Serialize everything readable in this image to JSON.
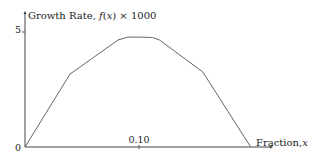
{
  "chart_data": {
    "type": "line",
    "title": "",
    "xlabel": "Fraction, x",
    "ylabel": "Growth Rate, f(x) × 1000",
    "ylabel_parts": {
      "prefix": "Growth Rate, ",
      "func": "f",
      "paren_open": "(",
      "var": "x",
      "paren_close": ")",
      "suffix": " × 1000"
    },
    "xlabel_parts": {
      "prefix": "Fraction,",
      "var": "x"
    },
    "x_ticks": [
      {
        "value": 0.1,
        "label": "0.10"
      }
    ],
    "y_ticks": [
      {
        "value": 5,
        "label": "5"
      }
    ],
    "origin_label": "0",
    "xlim": [
      0,
      0.22
    ],
    "ylim": [
      0,
      5.6
    ],
    "grid": false,
    "legend": "none",
    "series": [
      {
        "name": "f(x)",
        "x": [
          0,
          0.0395,
          0.0816,
          0.09,
          0.101,
          0.112,
          0.118,
          0.156,
          0.198
        ],
        "y": [
          0,
          3.17,
          4.65,
          4.78,
          4.78,
          4.76,
          4.65,
          3.26,
          0
        ]
      }
    ]
  }
}
